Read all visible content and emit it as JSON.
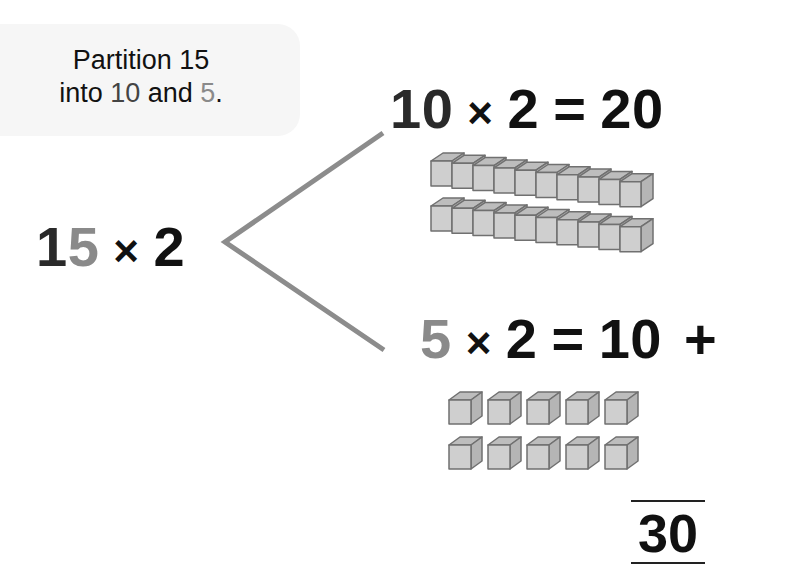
{
  "bubble": {
    "line1": "Partition 15",
    "line2_prefix": "into ",
    "line2_ten": "10",
    "line2_mid": " and ",
    "line2_five": "5",
    "line2_suffix": "."
  },
  "main_equation": {
    "tens_digit": "1",
    "ones_digit": "5",
    "times": "×",
    "factor": "2"
  },
  "top_branch": {
    "a": "10",
    "times": "×",
    "b": "2",
    "equals": "=",
    "result": "20",
    "blocks": {
      "rods": 2,
      "units_per_rod": 10,
      "label": "tens-rods"
    }
  },
  "bottom_branch": {
    "a": "5",
    "times": "×",
    "b": "2",
    "equals": "=",
    "result": "10",
    "plus": "+",
    "blocks": {
      "rows": 2,
      "cubes_per_row": 5,
      "label": "unit-cubes"
    }
  },
  "total": "30",
  "colors": {
    "text": "#111111",
    "ten_digit": "#2a2a2a",
    "five_digit": "#8a8a8a",
    "branch_line": "#8c8c8c",
    "block_face": "#cfcfcf",
    "block_top": "#bdbdbd",
    "block_edge": "#707070",
    "bubble_bg": "#f6f6f6"
  }
}
